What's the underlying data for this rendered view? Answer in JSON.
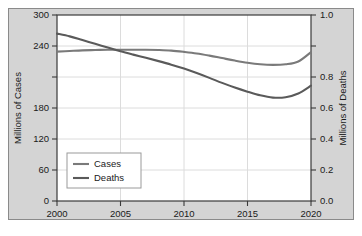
{
  "chart_data": {
    "type": "line",
    "title": "",
    "subtitle": "",
    "xlabel": "",
    "ylabel": "Millions of Cases",
    "ylabel_right": "Millions of Deaths",
    "xlim": [
      2000,
      2020
    ],
    "ylim": [
      0,
      300
    ],
    "ylim_right": [
      0.0,
      1.0
    ],
    "grid": true,
    "legend_position": "lower left",
    "xticks": [
      2000,
      2005,
      2010,
      2015,
      2020
    ],
    "xtick_labels": [
      "2000",
      "2005",
      "2010",
      "2015",
      "2020"
    ],
    "yticks": [
      0,
      60,
      120,
      180,
      240,
      300
    ],
    "ytick_labels": [
      "0",
      "60",
      "120",
      "180",
      "240",
      "300"
    ],
    "yticks_right": [
      0.0,
      0.2,
      0.4,
      0.6,
      0.8,
      1.0
    ],
    "ytick_labels_right": [
      "0.0",
      "0.2",
      "0.4",
      "0.6",
      "0.8",
      "1.0"
    ],
    "x": [
      2000,
      2001,
      2002,
      2003,
      2004,
      2005,
      2006,
      2007,
      2008,
      2009,
      2010,
      2011,
      2012,
      2013,
      2014,
      2015,
      2016,
      2017,
      2018,
      2019,
      2020
    ],
    "series": [
      {
        "name": "Cases",
        "axis": "left",
        "color": "#7a7a7a",
        "values": [
          241,
          242,
          243,
          243.5,
          244,
          244,
          244,
          244,
          243.5,
          242.5,
          240.5,
          238,
          234.5,
          230.5,
          226.5,
          223,
          220.5,
          219.5,
          220.5,
          225,
          240
        ]
      },
      {
        "name": "Deaths",
        "axis": "right",
        "color": "#5a5a5a",
        "values": [
          0.9,
          0.885,
          0.865,
          0.845,
          0.825,
          0.805,
          0.787,
          0.77,
          0.752,
          0.733,
          0.712,
          0.688,
          0.662,
          0.635,
          0.61,
          0.588,
          0.568,
          0.556,
          0.558,
          0.578,
          0.62
        ]
      }
    ],
    "legend_entries": [
      {
        "label": "Cases",
        "color": "#7a7a7a"
      },
      {
        "label": "Deaths",
        "color": "#5a5a5a"
      }
    ]
  },
  "colors": {
    "figure_background": "#d4d4d4",
    "plot_background": "#ffffff",
    "axis": "#3a3a3a",
    "grid": "#d8d8d8",
    "text": "#1a1a1a"
  }
}
